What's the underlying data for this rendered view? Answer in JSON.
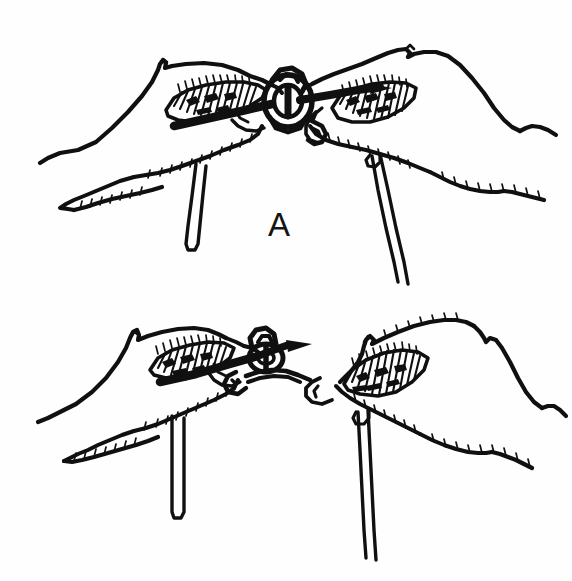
{
  "figure": {
    "kind": "line-drawing-illustration",
    "background_color": "#fefefe",
    "ink_color": "#101010",
    "width": 572,
    "height": 581,
    "panel_count": 2
  },
  "panels": [
    {
      "id": "panel-a",
      "label": "A",
      "label_x": 268,
      "label_y": 208,
      "caption": "",
      "elements": {
        "left_hand": "left hand gripping suture between thumb and index finger",
        "right_hand": "right hand gripping suture between thumb and index finger",
        "knot": "suture loop forming first throw of knot at center",
        "left_strand": "short doubled suture strand hanging below left hand",
        "right_strand": "long double suture strand running down from right hand"
      }
    },
    {
      "id": "panel-b",
      "label": "B",
      "label_x": 268,
      "label_y": 458,
      "caption": "",
      "elements": {
        "left_hand": "left hand with suture drawn across index finger",
        "right_hand": "right hand pinching suture end",
        "knot": "suture loop being tightened at center",
        "left_strand": "short doubled suture strand hanging below left hand",
        "right_strand": "long double suture strand running down from right hand"
      }
    }
  ]
}
